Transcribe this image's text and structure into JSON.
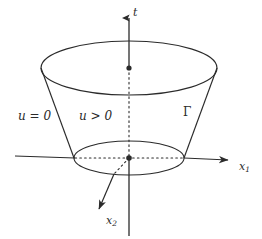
{
  "figure": {
    "name": "cone-support-diagram",
    "caption_labels": {
      "t_axis": "t",
      "x1_axis": "x₁",
      "x2_axis": "x₂",
      "x1_base": "x",
      "x1_sub": "1",
      "x2_base": "x",
      "x2_sub": "2",
      "u_zero": "u = 0",
      "u_positive": "u > 0",
      "gamma": "Γ"
    },
    "colors": {
      "stroke": "#2b2b2b",
      "background": "#ffffff",
      "text": "#2b2b2b"
    },
    "geometry": {
      "top_ellipse": {
        "cx": 129,
        "cy": 68,
        "rx": 88,
        "ry": 27
      },
      "bottom_ellipse": {
        "cx": 129,
        "cy": 158,
        "rx": 55,
        "ry": 17
      },
      "origin_dot": {
        "cx": 129,
        "cy": 158,
        "r": 2.6
      },
      "top_center_dot": {
        "cx": 129,
        "cy": 68,
        "r": 2.6
      }
    }
  }
}
